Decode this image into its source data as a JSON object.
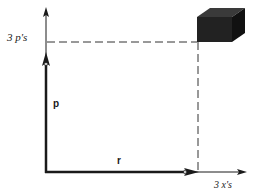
{
  "diagram": {
    "title": "",
    "labels": {
      "y_axis_mark": "3 p's",
      "x_axis_mark": "3 x's",
      "vector_p": "p",
      "vector_r": "r"
    },
    "elements": {
      "cube": "shaded cube at intersection of 3 x's and 3 p's",
      "vector_p": "thick vertical arrow from origin",
      "vector_r": "thick horizontal arrow from origin",
      "dashed_lines": [
        "horizontal at 3 p's to cube",
        "vertical from cube to 3 x's"
      ]
    },
    "colors": {
      "ink": "#1a1a1a",
      "cube_front": "#222222",
      "cube_top": "#3a3a3a",
      "cube_side": "#111111",
      "dash": "#333333"
    }
  }
}
